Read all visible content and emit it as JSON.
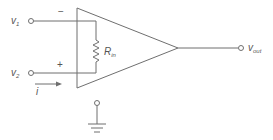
{
  "diagram": {
    "type": "op-amp equivalent input circuit",
    "inputs": [
      {
        "name": "v1",
        "label": "v",
        "subscript": "1",
        "polarity": "−"
      },
      {
        "name": "v2",
        "label": "v",
        "subscript": "2",
        "polarity": "+"
      }
    ],
    "resistor": {
      "label": "R",
      "subscript": "in"
    },
    "current": {
      "label": "i"
    },
    "output": {
      "label": "v",
      "subscript": "out"
    },
    "ground": true,
    "colors": {
      "line": "#6f6f6f",
      "text": "#555555",
      "background": "#ffffff"
    }
  }
}
